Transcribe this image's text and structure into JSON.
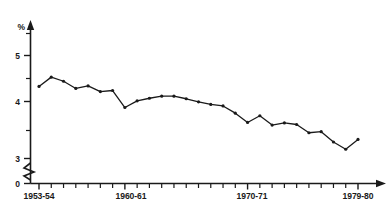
{
  "chart_data": {
    "type": "line",
    "title": "",
    "subtitle": "",
    "xlabel": "",
    "ylabel": "%",
    "ylim": [
      3,
      5.6
    ],
    "xlim": [
      0,
      26
    ],
    "grid": false,
    "legend": null,
    "axis_break": true,
    "axis_break_note": "y-axis broken between 0 and 3",
    "y_ticks_major": [
      3,
      4,
      5
    ],
    "y_ticks_major_labels": [
      "3",
      "4",
      "5"
    ],
    "y_tick_zero_label": "0",
    "y_ticks_minor": [
      3.5,
      4.5,
      5.5
    ],
    "x_tick_labels": [
      "1953-54",
      "1960-61",
      "1970-71",
      "1979-80"
    ],
    "x_tick_label_indices": [
      0,
      7,
      17,
      26
    ],
    "categories": [
      "1953-54",
      "1954-55",
      "1955-56",
      "1956-57",
      "1957-58",
      "1958-59",
      "1959-60",
      "1960-61",
      "1961-62",
      "1962-63",
      "1963-64",
      "1964-65",
      "1965-66",
      "1966-67",
      "1967-68",
      "1968-69",
      "1969-70",
      "1970-71",
      "1971-72",
      "1972-73",
      "1973-74",
      "1974-75",
      "1975-76",
      "1976-77",
      "1977-78",
      "1978-79",
      "1979-80"
    ],
    "values": [
      4.4,
      4.58,
      4.5,
      4.36,
      4.41,
      4.3,
      4.32,
      3.99,
      4.12,
      4.17,
      4.21,
      4.21,
      4.16,
      4.1,
      4.05,
      4.02,
      3.88,
      3.7,
      3.83,
      3.65,
      3.69,
      3.66,
      3.5,
      3.52,
      3.32,
      3.18,
      3.37
    ],
    "marker": "dot",
    "series": [
      {
        "name": "percentage",
        "values": [
          4.4,
          4.58,
          4.5,
          4.36,
          4.41,
          4.3,
          4.32,
          3.99,
          4.12,
          4.17,
          4.21,
          4.21,
          4.16,
          4.1,
          4.05,
          4.02,
          3.88,
          3.7,
          3.83,
          3.65,
          3.69,
          3.66,
          3.5,
          3.52,
          3.32,
          3.18,
          3.37
        ]
      }
    ],
    "tail_flat_values": [
      3.37,
      3.38,
      3.37
    ],
    "colors": {
      "line": "#1a1a1a",
      "axis": "#1a1a1a",
      "background": "#ffffff"
    }
  },
  "figure": {
    "ghost_header": ""
  }
}
